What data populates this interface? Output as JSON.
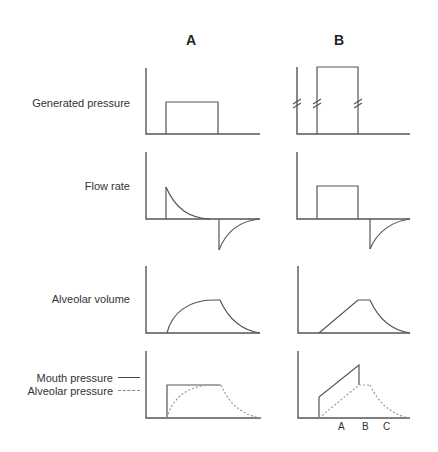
{
  "columns": [
    {
      "id": "A",
      "label": "A"
    },
    {
      "id": "B",
      "label": "B"
    }
  ],
  "rows": [
    {
      "id": "generated-pressure",
      "label": "Generated pressure"
    },
    {
      "id": "flow-rate",
      "label": "Flow rate"
    },
    {
      "id": "alveolar-volume",
      "label": "Alveolar volume"
    },
    {
      "id": "pressures",
      "label": ""
    }
  ],
  "legend": {
    "items": [
      {
        "label": "Mouth pressure",
        "style": "solid"
      },
      {
        "label": "Alveolar pressure",
        "style": "dashed"
      }
    ]
  },
  "time_markers": [
    "A",
    "B",
    "C"
  ],
  "colors": {
    "line": "#555555",
    "dashed": "#999999",
    "background": "#ffffff"
  }
}
